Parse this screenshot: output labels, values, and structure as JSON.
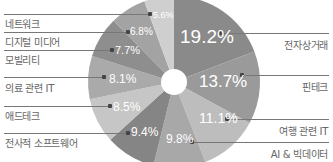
{
  "chart_data": {
    "type": "pie",
    "subtype": "donut",
    "title": "",
    "categories": [
      "전자상거래",
      "핀테크",
      "여행 관련 IT",
      "AI & 빅데이터",
      "전사적 소프트웨어",
      "애드테크",
      "의료 관련 IT",
      "모빌리티",
      "디지털 미디어",
      "네트워크"
    ],
    "values": [
      19.2,
      13.7,
      11.1,
      9.8,
      9.4,
      8.5,
      8.1,
      7.7,
      6.8,
      5.6
    ],
    "value_labels": [
      "19.2%",
      "13.7%",
      "11.1%",
      "9.8%",
      "9.4%",
      "8.5%",
      "8.1%",
      "7.7%",
      "6.8%",
      "5.6%"
    ],
    "colors": [
      "#8a8a8a",
      "#9a9a9a",
      "#bdbdbd",
      "#a8a8a8",
      "#858585",
      "#c6c6c6",
      "#aaaaaa",
      "#8e8e8e",
      "#a3a3a3",
      "#cfcfcf"
    ],
    "legend": "leader-line labels"
  },
  "labels": {
    "s0": "전자상거래",
    "s1": "핀테크",
    "s2": "여행 관련 IT",
    "s3": "AI & 빅데이터",
    "s4": "전사적 소프트웨어",
    "s5": "애드테크",
    "s6": "의료 관련 IT",
    "s7": "모빌리티",
    "s8": "디지털 미디어",
    "s9": "네트워크"
  },
  "pcts": {
    "s0": "19.2%",
    "s1": "13.7%",
    "s2": "11.1%",
    "s3": "9.8%",
    "s4": "9.4%",
    "s5": "8.5%",
    "s6": "8.1%",
    "s7": "7.7%",
    "s8": "6.8%",
    "s9": "5.6%"
  }
}
